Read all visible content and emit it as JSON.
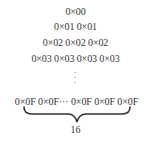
{
  "diagram": {
    "rows": [
      {
        "text": "0×00"
      },
      {
        "text": "0×01 0×01"
      },
      {
        "text": "0×02 0×02 0×02"
      },
      {
        "text": "0×03 0×03 0×03 0×03"
      }
    ],
    "ellipsis_vertical": "⋮",
    "last_row": {
      "text": "0×0F 0×0F··· 0×0F 0×0F 0×0F"
    },
    "brace_label": "16"
  }
}
